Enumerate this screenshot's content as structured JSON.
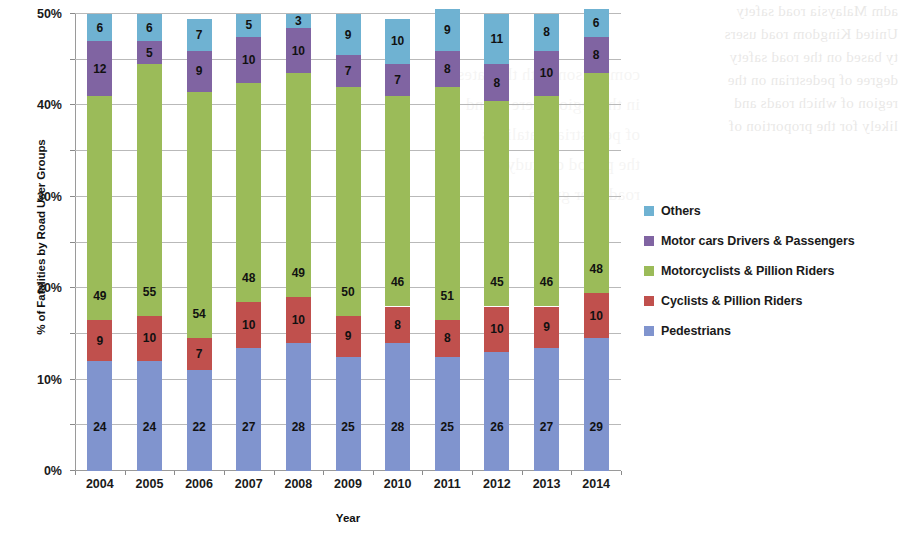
{
  "chart_data": {
    "type": "bar",
    "subtype": "stacked-100-percent",
    "title": "",
    "xlabel": "Year",
    "ylabel": "% of Fatalities by Road User Groups",
    "categories": [
      "2004",
      "2005",
      "2006",
      "2007",
      "2008",
      "2009",
      "2010",
      "2011",
      "2012",
      "2013",
      "2014"
    ],
    "ylim": [
      0,
      100
    ],
    "ytick_labels": [
      "0%",
      "10%",
      "20%",
      "30%",
      "40%",
      "50%",
      "60%",
      "70%",
      "80%",
      "90%",
      "100%"
    ],
    "ytick_values": [
      0,
      10,
      20,
      30,
      40,
      50,
      60,
      70,
      80,
      90,
      100
    ],
    "grid": true,
    "legend_position": "right",
    "series": [
      {
        "name": "Pedestrians",
        "color": "#8094CE",
        "values": [
          24,
          24,
          22,
          27,
          28,
          25,
          28,
          25,
          26,
          27,
          29
        ]
      },
      {
        "name": "Cyclists & Pillion Riders",
        "color": "#C0504D",
        "values": [
          9,
          10,
          7,
          10,
          10,
          9,
          8,
          8,
          10,
          9,
          10
        ]
      },
      {
        "name": "Motorcyclists & Pillion Riders",
        "color": "#9BBB59",
        "values": [
          49,
          55,
          54,
          48,
          49,
          50,
          46,
          51,
          45,
          46,
          48
        ]
      },
      {
        "name": "Motor cars Drivers & Passengers",
        "color": "#8064A2",
        "values": [
          12,
          5,
          9,
          10,
          10,
          7,
          7,
          8,
          8,
          10,
          8
        ]
      },
      {
        "name": "Others",
        "color": "#6FB2D2",
        "values": [
          6,
          6,
          7,
          5,
          3,
          9,
          10,
          9,
          11,
          8,
          6
        ]
      }
    ],
    "legend_order_top_to_bottom": [
      "Others",
      "Motor cars Drivers & Passengers",
      "Motorcyclists & Pillion Riders",
      "Cyclists & Pillion Riders",
      "Pedestrians"
    ]
  },
  "bleed_text": {
    "right": "adm Malaysia road safety\nUnited Kingdom road users\nty based on the road safety\ndegree of pedestrian on the\nregion of which roads and\nlikely for the proportion of",
    "center": "comparison with the rates\nin the region were found\nof pedestrian fatalities\nthe period of study\nroad user group"
  }
}
